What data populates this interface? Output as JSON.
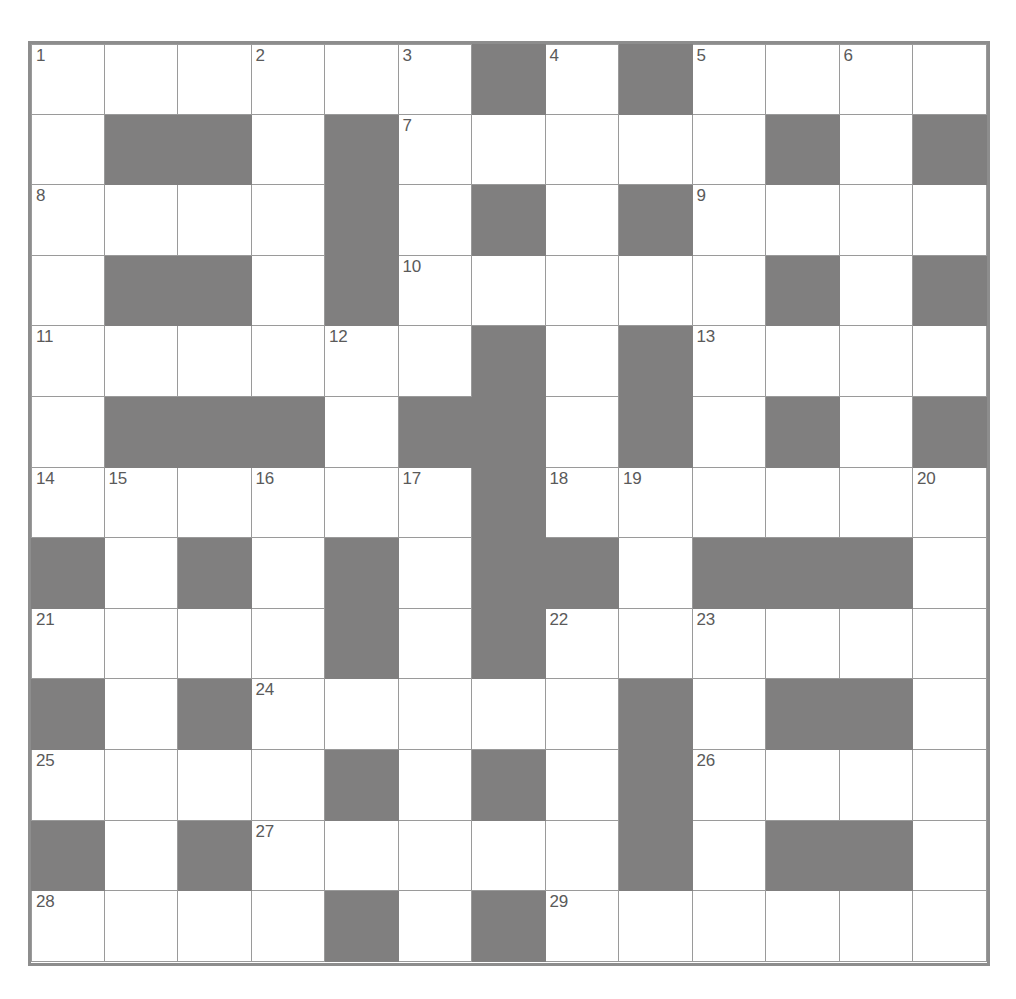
{
  "puzzle": {
    "title": "Crossword Grid",
    "columns": 13,
    "rows": 13,
    "colors": {
      "block": "#807f7f",
      "open": "#ffffff",
      "gridline": "#9a9a9a",
      "border": "#8d8d8d",
      "number_text": "#5a5a5a",
      "page_background": "#ffffff"
    },
    "legend": {
      "block_label": "blocked square",
      "open_label": "open square"
    },
    "clue_numbers": [
      1,
      2,
      3,
      4,
      5,
      6,
      7,
      8,
      9,
      10,
      11,
      12,
      13,
      14,
      15,
      16,
      17,
      18,
      19,
      20,
      21,
      22,
      23,
      24,
      25,
      26,
      27,
      28,
      29
    ],
    "highest_clue_number": 29,
    "cells": [
      [
        {
          "block": false,
          "num": "1"
        },
        {
          "block": false,
          "num": ""
        },
        {
          "block": false,
          "num": ""
        },
        {
          "block": false,
          "num": "2"
        },
        {
          "block": false,
          "num": ""
        },
        {
          "block": false,
          "num": "3"
        },
        {
          "block": true,
          "num": ""
        },
        {
          "block": false,
          "num": "4"
        },
        {
          "block": true,
          "num": ""
        },
        {
          "block": false,
          "num": "5"
        },
        {
          "block": false,
          "num": ""
        },
        {
          "block": false,
          "num": "6"
        },
        {
          "block": false,
          "num": ""
        }
      ],
      [
        {
          "block": false,
          "num": ""
        },
        {
          "block": true,
          "num": ""
        },
        {
          "block": true,
          "num": ""
        },
        {
          "block": false,
          "num": ""
        },
        {
          "block": true,
          "num": ""
        },
        {
          "block": false,
          "num": "7"
        },
        {
          "block": false,
          "num": ""
        },
        {
          "block": false,
          "num": ""
        },
        {
          "block": false,
          "num": ""
        },
        {
          "block": false,
          "num": ""
        },
        {
          "block": true,
          "num": ""
        },
        {
          "block": false,
          "num": ""
        },
        {
          "block": true,
          "num": ""
        }
      ],
      [
        {
          "block": false,
          "num": "8"
        },
        {
          "block": false,
          "num": ""
        },
        {
          "block": false,
          "num": ""
        },
        {
          "block": false,
          "num": ""
        },
        {
          "block": true,
          "num": ""
        },
        {
          "block": false,
          "num": ""
        },
        {
          "block": true,
          "num": ""
        },
        {
          "block": false,
          "num": ""
        },
        {
          "block": true,
          "num": ""
        },
        {
          "block": false,
          "num": "9"
        },
        {
          "block": false,
          "num": ""
        },
        {
          "block": false,
          "num": ""
        },
        {
          "block": false,
          "num": ""
        }
      ],
      [
        {
          "block": false,
          "num": ""
        },
        {
          "block": true,
          "num": ""
        },
        {
          "block": true,
          "num": ""
        },
        {
          "block": false,
          "num": ""
        },
        {
          "block": true,
          "num": ""
        },
        {
          "block": false,
          "num": "10"
        },
        {
          "block": false,
          "num": ""
        },
        {
          "block": false,
          "num": ""
        },
        {
          "block": false,
          "num": ""
        },
        {
          "block": false,
          "num": ""
        },
        {
          "block": true,
          "num": ""
        },
        {
          "block": false,
          "num": ""
        },
        {
          "block": true,
          "num": ""
        }
      ],
      [
        {
          "block": false,
          "num": "11"
        },
        {
          "block": false,
          "num": ""
        },
        {
          "block": false,
          "num": ""
        },
        {
          "block": false,
          "num": ""
        },
        {
          "block": false,
          "num": "12"
        },
        {
          "block": false,
          "num": ""
        },
        {
          "block": true,
          "num": ""
        },
        {
          "block": false,
          "num": ""
        },
        {
          "block": true,
          "num": ""
        },
        {
          "block": false,
          "num": "13"
        },
        {
          "block": false,
          "num": ""
        },
        {
          "block": false,
          "num": ""
        },
        {
          "block": false,
          "num": ""
        }
      ],
      [
        {
          "block": false,
          "num": ""
        },
        {
          "block": true,
          "num": ""
        },
        {
          "block": true,
          "num": ""
        },
        {
          "block": true,
          "num": ""
        },
        {
          "block": false,
          "num": ""
        },
        {
          "block": true,
          "num": ""
        },
        {
          "block": true,
          "num": ""
        },
        {
          "block": false,
          "num": ""
        },
        {
          "block": true,
          "num": ""
        },
        {
          "block": false,
          "num": ""
        },
        {
          "block": true,
          "num": ""
        },
        {
          "block": false,
          "num": ""
        },
        {
          "block": true,
          "num": ""
        }
      ],
      [
        {
          "block": false,
          "num": "14"
        },
        {
          "block": false,
          "num": "15"
        },
        {
          "block": false,
          "num": ""
        },
        {
          "block": false,
          "num": "16"
        },
        {
          "block": false,
          "num": ""
        },
        {
          "block": false,
          "num": "17"
        },
        {
          "block": true,
          "num": ""
        },
        {
          "block": false,
          "num": "18"
        },
        {
          "block": false,
          "num": "19"
        },
        {
          "block": false,
          "num": ""
        },
        {
          "block": false,
          "num": ""
        },
        {
          "block": false,
          "num": ""
        },
        {
          "block": false,
          "num": "20"
        }
      ],
      [
        {
          "block": true,
          "num": ""
        },
        {
          "block": false,
          "num": ""
        },
        {
          "block": true,
          "num": ""
        },
        {
          "block": false,
          "num": ""
        },
        {
          "block": true,
          "num": ""
        },
        {
          "block": false,
          "num": ""
        },
        {
          "block": true,
          "num": ""
        },
        {
          "block": true,
          "num": ""
        },
        {
          "block": false,
          "num": ""
        },
        {
          "block": true,
          "num": ""
        },
        {
          "block": true,
          "num": ""
        },
        {
          "block": true,
          "num": ""
        },
        {
          "block": false,
          "num": ""
        }
      ],
      [
        {
          "block": false,
          "num": "21"
        },
        {
          "block": false,
          "num": ""
        },
        {
          "block": false,
          "num": ""
        },
        {
          "block": false,
          "num": ""
        },
        {
          "block": true,
          "num": ""
        },
        {
          "block": false,
          "num": ""
        },
        {
          "block": true,
          "num": ""
        },
        {
          "block": false,
          "num": "22"
        },
        {
          "block": false,
          "num": ""
        },
        {
          "block": false,
          "num": "23"
        },
        {
          "block": false,
          "num": ""
        },
        {
          "block": false,
          "num": ""
        },
        {
          "block": false,
          "num": ""
        }
      ],
      [
        {
          "block": true,
          "num": ""
        },
        {
          "block": false,
          "num": ""
        },
        {
          "block": true,
          "num": ""
        },
        {
          "block": false,
          "num": "24"
        },
        {
          "block": false,
          "num": ""
        },
        {
          "block": false,
          "num": ""
        },
        {
          "block": false,
          "num": ""
        },
        {
          "block": false,
          "num": ""
        },
        {
          "block": true,
          "num": ""
        },
        {
          "block": false,
          "num": ""
        },
        {
          "block": true,
          "num": ""
        },
        {
          "block": true,
          "num": ""
        },
        {
          "block": false,
          "num": ""
        }
      ],
      [
        {
          "block": false,
          "num": "25"
        },
        {
          "block": false,
          "num": ""
        },
        {
          "block": false,
          "num": ""
        },
        {
          "block": false,
          "num": ""
        },
        {
          "block": true,
          "num": ""
        },
        {
          "block": false,
          "num": ""
        },
        {
          "block": true,
          "num": ""
        },
        {
          "block": false,
          "num": ""
        },
        {
          "block": true,
          "num": ""
        },
        {
          "block": false,
          "num": "26"
        },
        {
          "block": false,
          "num": ""
        },
        {
          "block": false,
          "num": ""
        },
        {
          "block": false,
          "num": ""
        }
      ],
      [
        {
          "block": true,
          "num": ""
        },
        {
          "block": false,
          "num": ""
        },
        {
          "block": true,
          "num": ""
        },
        {
          "block": false,
          "num": "27"
        },
        {
          "block": false,
          "num": ""
        },
        {
          "block": false,
          "num": ""
        },
        {
          "block": false,
          "num": ""
        },
        {
          "block": false,
          "num": ""
        },
        {
          "block": true,
          "num": ""
        },
        {
          "block": false,
          "num": ""
        },
        {
          "block": true,
          "num": ""
        },
        {
          "block": true,
          "num": ""
        },
        {
          "block": false,
          "num": ""
        }
      ],
      [
        {
          "block": false,
          "num": "28"
        },
        {
          "block": false,
          "num": ""
        },
        {
          "block": false,
          "num": ""
        },
        {
          "block": false,
          "num": ""
        },
        {
          "block": true,
          "num": ""
        },
        {
          "block": false,
          "num": ""
        },
        {
          "block": true,
          "num": ""
        },
        {
          "block": false,
          "num": "29"
        },
        {
          "block": false,
          "num": ""
        },
        {
          "block": false,
          "num": ""
        },
        {
          "block": false,
          "num": ""
        },
        {
          "block": false,
          "num": ""
        },
        {
          "block": false,
          "num": ""
        }
      ]
    ]
  }
}
